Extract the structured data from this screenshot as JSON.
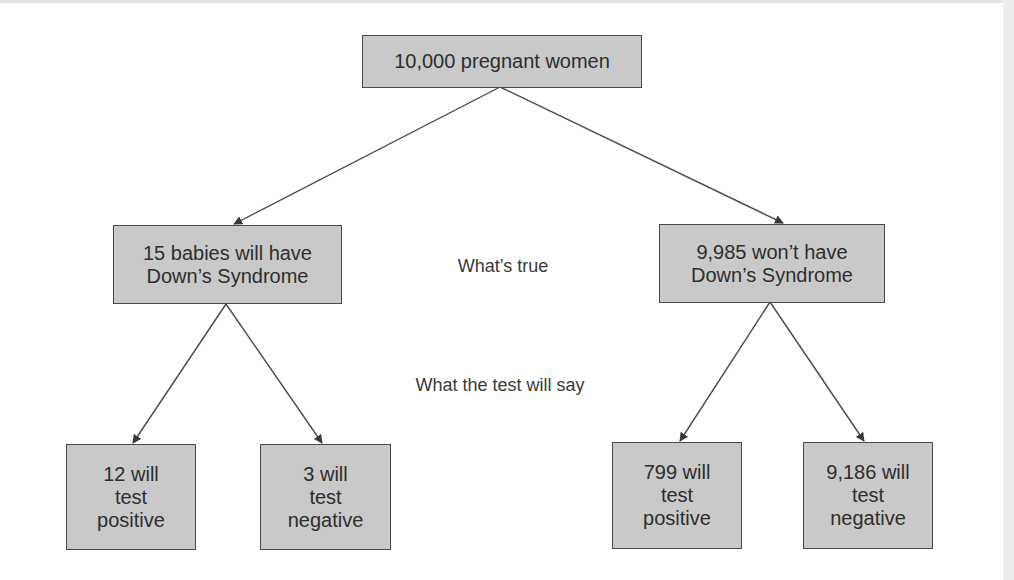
{
  "diagram": {
    "root": {
      "lines": [
        "10,000 pregnant women"
      ]
    },
    "level_labels": {
      "truth": "What’s true",
      "test": "What the test will say"
    },
    "branches": [
      {
        "lines": [
          "15 babies will have",
          "Down’s Syndrome"
        ],
        "children": [
          {
            "lines": [
              "12 will",
              "test",
              "positive"
            ]
          },
          {
            "lines": [
              "3 will",
              "test",
              "negative"
            ]
          }
        ]
      },
      {
        "lines": [
          "9,985 won’t have",
          "Down’s Syndrome"
        ],
        "children": [
          {
            "lines": [
              "799 will",
              "test",
              "positive"
            ]
          },
          {
            "lines": [
              "9,186 will",
              "test",
              "negative"
            ]
          }
        ]
      }
    ],
    "colors": {
      "box_fill": "#c9c9c9",
      "box_border": "#4a4a4a",
      "line": "#4a4a4a",
      "background": "#ffffff"
    }
  }
}
